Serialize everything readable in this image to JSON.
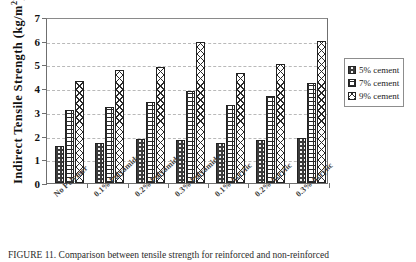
{
  "chart_data": {
    "type": "bar",
    "title": "",
    "xlabel": "",
    "ylabel": "Indirect  Tensile  Strength (kg/m",
    "ylabel_sup": "2",
    "ylabel_tail": ")",
    "ylim": [
      0,
      7
    ],
    "yticks": [
      "0",
      "1",
      "2",
      "3",
      "4",
      "5",
      "6",
      "7"
    ],
    "grid": "horizontal-dashed",
    "legend_position": "right",
    "categories": [
      "No Polymer",
      "0.1% Polyamide",
      "0.2% Polyamide",
      "0.3% Polyamide",
      "0.1% Acrylic",
      "0.2% Acrylic",
      "0.3% Acrylic"
    ],
    "series": [
      {
        "name": "5% cement",
        "pattern": "dark-checker",
        "values": [
          1.55,
          1.7,
          1.85,
          1.8,
          1.7,
          1.8,
          1.9
        ]
      },
      {
        "name": "7% cement",
        "pattern": "brick-grid",
        "values": [
          3.1,
          3.2,
          3.4,
          3.9,
          3.3,
          3.65,
          4.2
        ]
      },
      {
        "name": "9% cement",
        "pattern": "crosshatch",
        "values": [
          4.3,
          4.75,
          4.9,
          5.95,
          4.65,
          5.0,
          6.0
        ]
      }
    ]
  },
  "legend": {
    "items": [
      {
        "label": "5% cement"
      },
      {
        "label": "7% cement"
      },
      {
        "label": "9% cement"
      }
    ]
  },
  "caption": {
    "text": "FIGURE 11.  Comparison between tensile strength for reinforced and non-reinforced"
  }
}
